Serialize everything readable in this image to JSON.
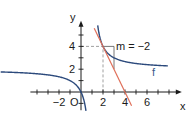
{
  "chart_data": {
    "type": "line",
    "title": "",
    "xlabel": "x",
    "ylabel": "y",
    "xlim": [
      -4.6,
      8.8
    ],
    "ylim": [
      -1.6,
      5.9
    ],
    "origin_label": "O",
    "x_ticks": [
      -4,
      -3,
      -2,
      -1,
      1,
      2,
      3,
      4,
      5,
      6,
      7,
      8
    ],
    "x_tick_labels": [
      {
        "value": -2,
        "text": "−2"
      },
      {
        "value": 2,
        "text": "2"
      },
      {
        "value": 4,
        "text": "4"
      },
      {
        "value": 6,
        "text": "6"
      }
    ],
    "y_ticks": [
      -1,
      1,
      2,
      3,
      4,
      5
    ],
    "y_tick_labels": [
      {
        "value": 2,
        "text": "2"
      },
      {
        "value": 4,
        "text": "4"
      }
    ],
    "grid": false,
    "series": [
      {
        "name": "f",
        "label": "f",
        "formula": "f(x) = 2 + 2/(x - 1)",
        "asymptotes": {
          "vertical": 1,
          "horizontal": 2
        },
        "color": "#2c4a7c"
      },
      {
        "name": "tangent",
        "formula": "t(x) = -2x + 8",
        "slope": -2,
        "intercept": 8,
        "x_range": [
          1.2,
          4.6
        ],
        "color": "#e0705a"
      }
    ],
    "annotations": [
      {
        "type": "point",
        "x": 2,
        "y": 4
      },
      {
        "type": "dashed-guides",
        "x": 2,
        "y": 4
      },
      {
        "type": "slope-triangle",
        "x0": 2,
        "y0": 4,
        "run": 1,
        "rise": -2
      },
      {
        "type": "text",
        "text": "m = −2",
        "x": 3.1,
        "y": 4
      }
    ]
  }
}
